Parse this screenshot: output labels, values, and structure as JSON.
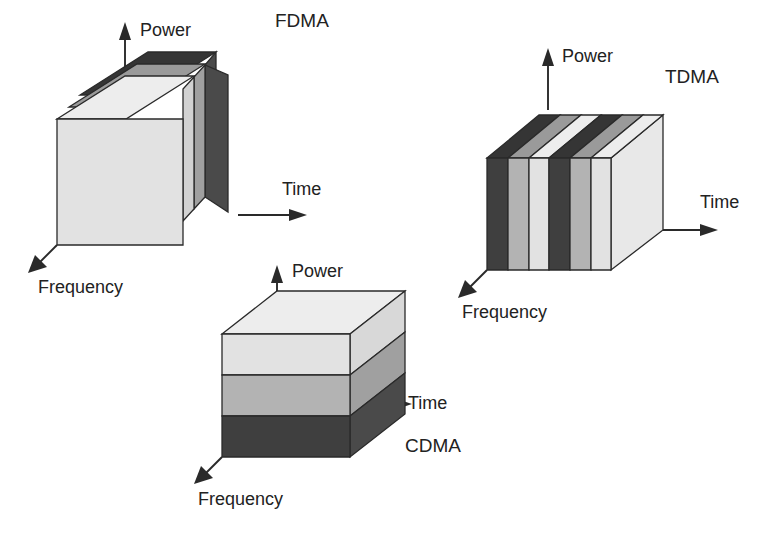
{
  "figure": {
    "background_color": "#ffffff",
    "line_color": "#2a2a2a",
    "text_color": "#222222"
  },
  "palette": {
    "dark": "#3f3f3f",
    "dark_side": "#4a4a4a",
    "dark_top": "#353535",
    "medium": "#b3b3b3",
    "medium_side": "#a0a0a0",
    "medium_top": "#9a9a9a",
    "light": "#e2e2e2",
    "light_side": "#d2d2d2",
    "light_top": "#ededed"
  },
  "axis_labels": {
    "power": "Power",
    "time": "Time",
    "frequency": "Frequency"
  },
  "schemes": [
    {
      "id": "fdma",
      "name": "FDMA",
      "label": "FDMA",
      "split_axis": "frequency",
      "description": "Channel divided into frequency bands; each user occupies one band for all time.",
      "slices": [
        {
          "index": 0,
          "shade": "light"
        },
        {
          "index": 1,
          "shade": "medium"
        },
        {
          "index": 2,
          "shade": "dark"
        }
      ],
      "axes": {
        "power": "Power",
        "time": "Time",
        "frequency": "Frequency"
      }
    },
    {
      "id": "tdma",
      "name": "TDMA",
      "label": "TDMA",
      "split_axis": "time",
      "description": "Channel divided into time slots; each user transmits in a repeating slot across the full band.",
      "slices": [
        {
          "index": 0,
          "shade": "dark"
        },
        {
          "index": 1,
          "shade": "medium"
        },
        {
          "index": 2,
          "shade": "light"
        },
        {
          "index": 3,
          "shade": "dark"
        },
        {
          "index": 4,
          "shade": "medium"
        },
        {
          "index": 5,
          "shade": "light"
        }
      ],
      "axes": {
        "power": "Power",
        "time": "Time",
        "frequency": "Frequency"
      }
    },
    {
      "id": "cdma",
      "name": "CDMA",
      "label": "CDMA",
      "split_axis": "power",
      "description": "All users share the full time and frequency extent, separated by code at different power layers.",
      "slices": [
        {
          "index": 0,
          "shade": "light"
        },
        {
          "index": 1,
          "shade": "medium"
        },
        {
          "index": 2,
          "shade": "dark"
        }
      ],
      "axes": {
        "power": "Power",
        "time": "Time",
        "frequency": "Frequency"
      }
    }
  ]
}
